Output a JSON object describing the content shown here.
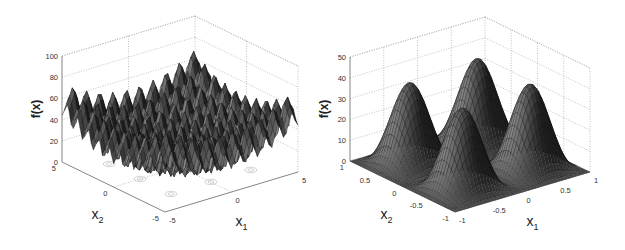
{
  "chart_data": [
    {
      "type": "surface3d",
      "title": "",
      "function": "Rastrigin-like multimodal surface",
      "xlabel": "x1",
      "ylabel": "x2",
      "zlabel": "f(x)",
      "xlim": [
        -5,
        5
      ],
      "ylim": [
        -5,
        5
      ],
      "zlim": [
        0,
        100
      ],
      "xticks": [
        "-5",
        "0",
        "5"
      ],
      "yticks": [
        "-5",
        "0",
        "5"
      ],
      "zticks": [
        "0",
        "20",
        "40",
        "60",
        "80",
        "100"
      ],
      "grid": true,
      "contour_on_floor": true,
      "peak_max_approx": 80,
      "global_min": {
        "x1": 0,
        "x2": 0,
        "f": 0
      }
    },
    {
      "type": "surface3d",
      "title": "",
      "function": "four-peak smooth surface",
      "xlabel": "x1",
      "ylabel": "x2",
      "zlabel": "f(x)",
      "xlim": [
        -1,
        1
      ],
      "ylim": [
        -1,
        1
      ],
      "zlim": [
        0,
        50
      ],
      "xticks": [
        "-1",
        "-0.5",
        "0",
        "0.5",
        "1"
      ],
      "yticks": [
        "-1",
        "-0.5",
        "0",
        "0.5",
        "1"
      ],
      "zticks": [
        "0",
        "10",
        "20",
        "30",
        "40",
        "50"
      ],
      "grid": true,
      "contour_on_floor": true,
      "peaks": [
        {
          "x1": -0.5,
          "x2": 0.5,
          "f": 40
        },
        {
          "x1": 0.5,
          "x2": 0.5,
          "f": 40
        },
        {
          "x1": -0.5,
          "x2": -0.5,
          "f": 40
        },
        {
          "x1": 0.5,
          "x2": -0.5,
          "f": 40
        }
      ]
    }
  ],
  "left": {
    "zlabel": "f(x)",
    "x1_label": "x",
    "x1_sub": "1",
    "x2_label": "x",
    "x2_sub": "2",
    "zticks": [
      "100",
      "80",
      "60",
      "40",
      "20",
      "0"
    ],
    "x2ticks": [
      "5",
      "0",
      "-5"
    ],
    "x1ticks": [
      "-5",
      "0",
      "5"
    ]
  },
  "right": {
    "zlabel": "f(x)",
    "x1_label": "x",
    "x1_sub": "1",
    "x2_label": "x",
    "x2_sub": "2",
    "zticks": [
      "50",
      "40",
      "30",
      "20",
      "10",
      "0"
    ],
    "x2ticks": [
      "1",
      "0.5",
      "0",
      "-0.5",
      "-1"
    ],
    "x1ticks": [
      "-1",
      "-0.5",
      "0",
      "0.5",
      "1"
    ]
  },
  "colors": {
    "surface_dark": "#1e1e1e",
    "surface_light": "#8a8a8a",
    "grid": "#9a9a9a",
    "contour": "#a8a8a8"
  }
}
